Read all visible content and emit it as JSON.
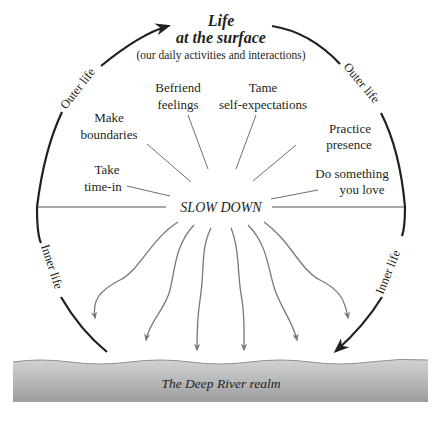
{
  "title": {
    "line1": "Life",
    "line2": "at the surface",
    "subtitle": "(our daily activities and interactions)"
  },
  "arc_labels": {
    "outer_left": "Outer life",
    "outer_right": "Outer life",
    "inner_left": "Inner life",
    "inner_right": "Inner life"
  },
  "center": {
    "label": "SLOW DOWN"
  },
  "practices": [
    {
      "line1": "Take",
      "line2": "time-in"
    },
    {
      "line1": "Make",
      "line2": "boundaries"
    },
    {
      "line1": "Befriend",
      "line2": "feelings"
    },
    {
      "line1": "Tame",
      "line2": "self-expectations"
    },
    {
      "line1": "Practice",
      "line2": "presence"
    },
    {
      "line1": "Do something",
      "line2": "you love"
    }
  ],
  "river": {
    "label": "The Deep River realm"
  },
  "colors": {
    "ink": "#231f20",
    "line_gray": "#6d6e70",
    "arrow_gray": "#77787b",
    "river_top": "#c8c9cb",
    "river_bottom": "#9a9b9d",
    "divider": "#8a8b8d"
  }
}
